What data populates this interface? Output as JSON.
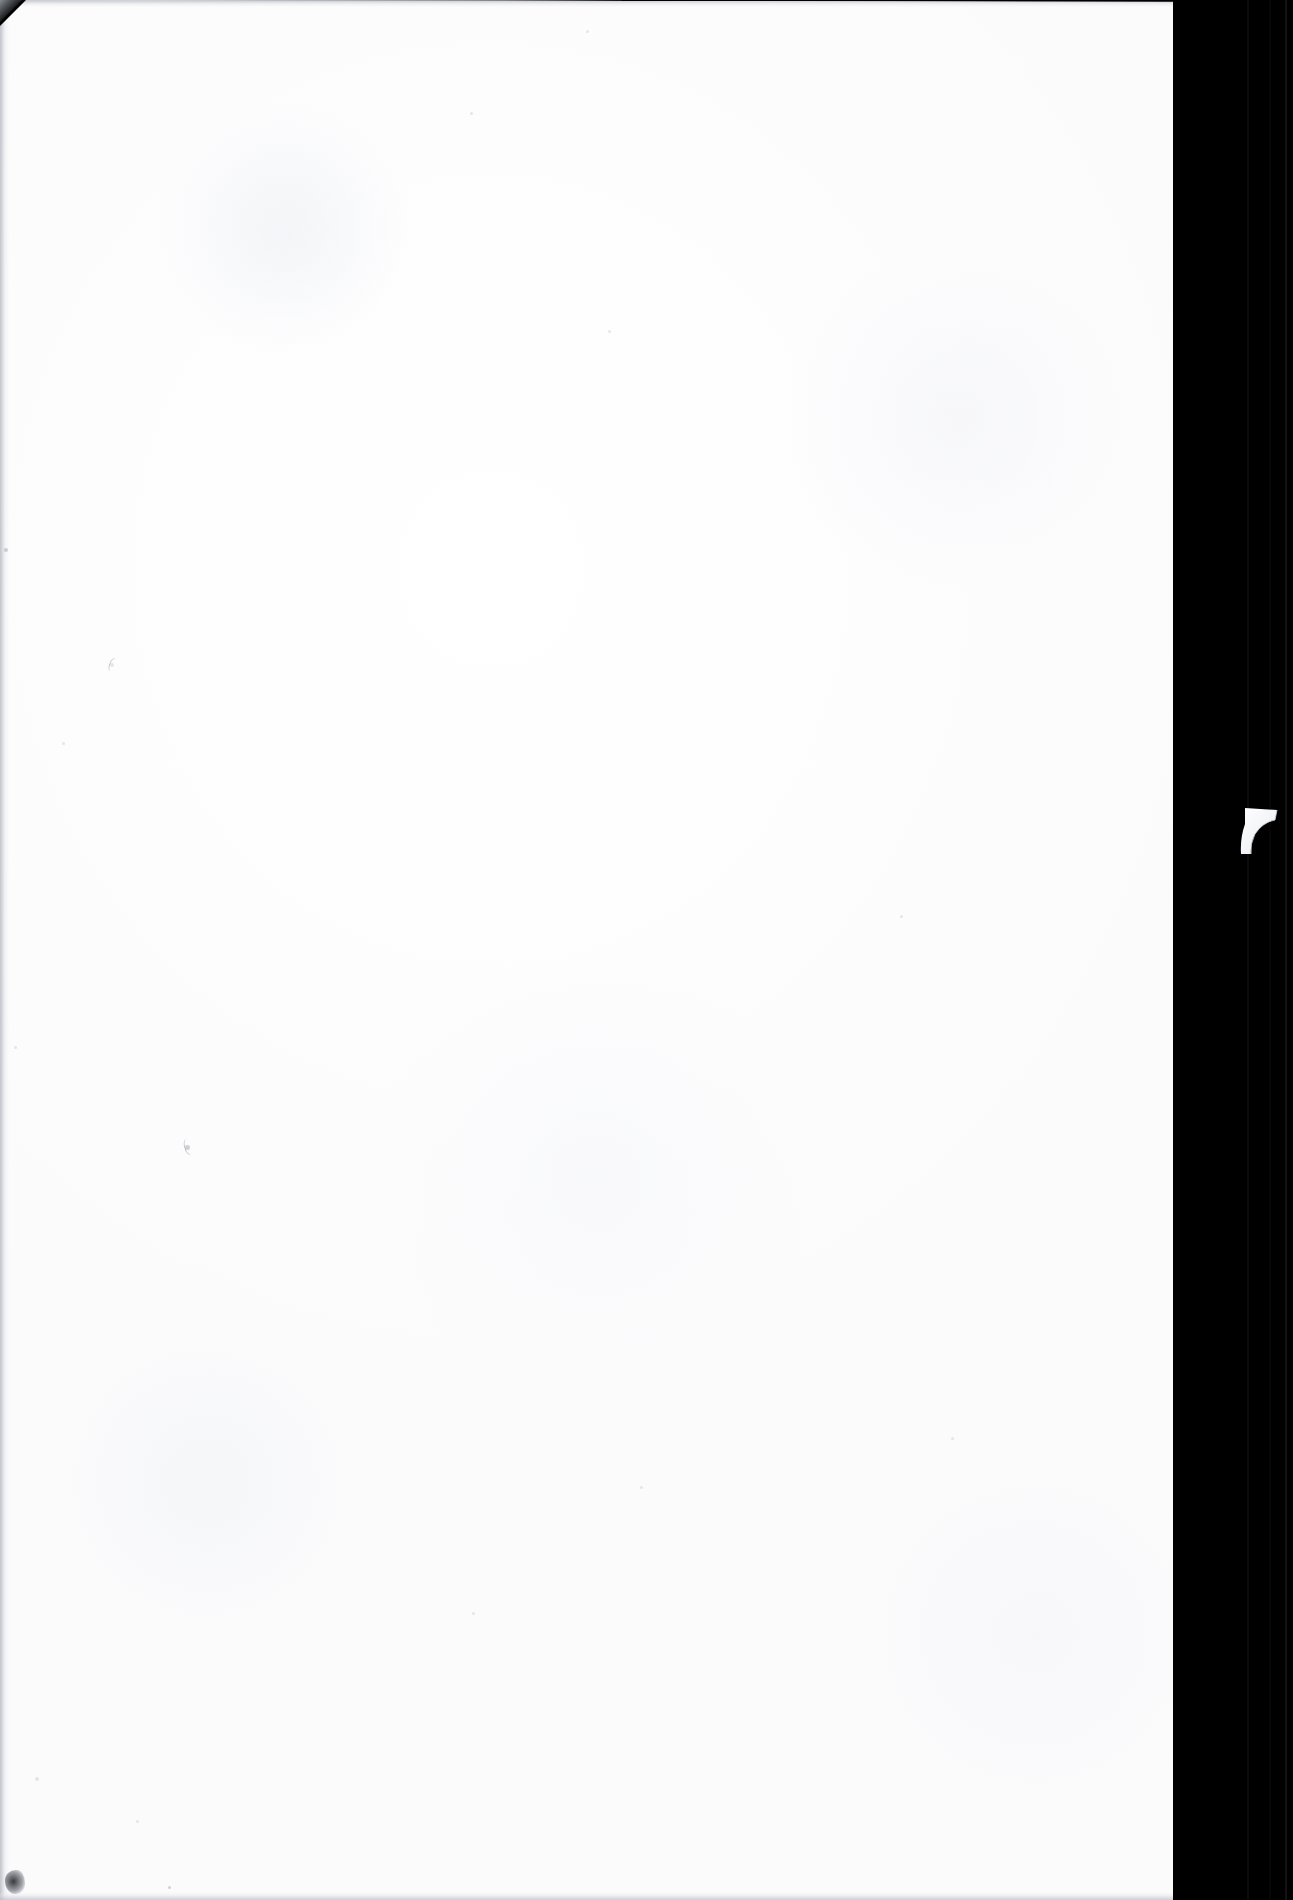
{
  "document": {
    "kind": "scanned-page",
    "side": "blank verso",
    "page_width_px": 1293,
    "page_height_px": 1900,
    "visible_text": "",
    "notes_visible_on_page": "none — the page carries no printed or handwritten text"
  },
  "colors": {
    "paper": "#fdfdfe",
    "paper_shadow": "#f2f3f6",
    "gutter_black": "#000000",
    "gutter_seam": "#101012",
    "edge_gray": "#b9bcc3",
    "speck_gray": "#8e9299",
    "smudge_dark": "#282a30"
  },
  "regions": {
    "paper_sheet": {
      "label": "paper-sheet",
      "left_px": 0,
      "top_px": 0,
      "right_edge_px": 1248,
      "bottom_px": 1900
    },
    "scanner_gutter": {
      "label": "scanner-gutter",
      "left_px": 1173,
      "width_px": 120
    },
    "torn_edge": {
      "label": "torn-right-edge",
      "start_y_px": 978,
      "end_y_px": 1400,
      "min_x_px": 1214,
      "max_x_px": 1248
    },
    "paper_flap": {
      "label": "curled-paper-flap",
      "left_px": 1239,
      "top_px": 804,
      "width_px": 42,
      "height_px": 56
    },
    "corner_chamfer": {
      "label": "top-left-chamfer",
      "size_px": 26
    },
    "corner_smudge": {
      "label": "bottom-left-smudge",
      "left_px": 5,
      "bottom_px": 6,
      "width_px": 20,
      "height_px": 24
    }
  },
  "blemishes": [
    {
      "name": "speck",
      "x": 110,
      "y": 663,
      "size": 4,
      "tone": "faint"
    },
    {
      "name": "speck",
      "x": 185,
      "y": 1145,
      "size": 5,
      "tone": "normal"
    },
    {
      "name": "speck",
      "x": 586,
      "y": 30,
      "size": 3,
      "tone": "faint"
    },
    {
      "name": "speck",
      "x": 470,
      "y": 112,
      "size": 3,
      "tone": "faint"
    },
    {
      "name": "speck",
      "x": 608,
      "y": 330,
      "size": 3,
      "tone": "faint"
    },
    {
      "name": "speck",
      "x": 4,
      "y": 548,
      "size": 4,
      "tone": "normal"
    },
    {
      "name": "speck",
      "x": 62,
      "y": 742,
      "size": 3,
      "tone": "faint"
    },
    {
      "name": "speck",
      "x": 900,
      "y": 915,
      "size": 3,
      "tone": "faint"
    },
    {
      "name": "speck",
      "x": 14,
      "y": 1046,
      "size": 3,
      "tone": "faint"
    },
    {
      "name": "speck",
      "x": 951,
      "y": 1437,
      "size": 3,
      "tone": "faint"
    },
    {
      "name": "speck",
      "x": 640,
      "y": 1486,
      "size": 3,
      "tone": "faint"
    },
    {
      "name": "speck",
      "x": 472,
      "y": 1612,
      "size": 3,
      "tone": "faint"
    },
    {
      "name": "speck",
      "x": 168,
      "y": 1886,
      "size": 3,
      "tone": "normal"
    },
    {
      "name": "speck",
      "x": 136,
      "y": 1820,
      "size": 3,
      "tone": "faint"
    },
    {
      "name": "speck",
      "x": 35,
      "y": 1777,
      "size": 4,
      "tone": "faint"
    }
  ]
}
